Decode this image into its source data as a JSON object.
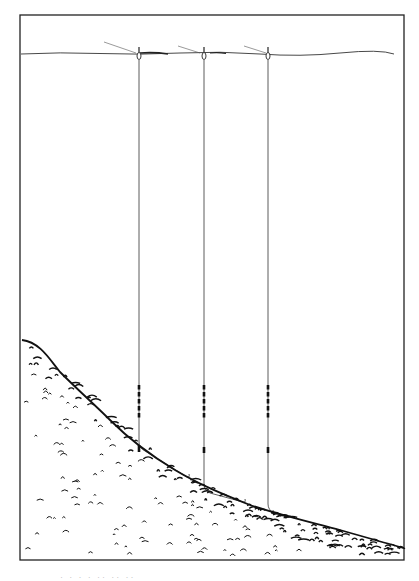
{
  "figure": {
    "frame": {
      "x": 20,
      "y": 15,
      "width": 384,
      "height": 545,
      "stroke": "#222222"
    },
    "water_surface_y": 53,
    "line_color": "#333333",
    "bed_color": "#111111",
    "rigs": [
      {
        "name": "rig-left",
        "x": 139,
        "bottom_y": 448,
        "tail_end": [
          187,
          477
        ],
        "shot_bands": [
          [
            385,
            420
          ],
          [
            445,
            452
          ]
        ],
        "has_second_shot": false,
        "rod_line": [
          [
            104,
            42
          ],
          [
            136,
            53
          ]
        ]
      },
      {
        "name": "rig-middle",
        "x": 204,
        "bottom_y": 490,
        "tail_end": [
          243,
          502
        ],
        "shot_bands": [
          [
            385,
            420
          ],
          [
            447,
            453
          ]
        ],
        "has_second_shot": true,
        "rod_line": [
          [
            178,
            46
          ],
          [
            200,
            53
          ]
        ]
      },
      {
        "name": "rig-right",
        "x": 268,
        "bottom_y": 510,
        "tail_end": [
          271,
          513
        ],
        "shot_bands": [
          [
            385,
            420
          ],
          [
            447,
            453
          ]
        ],
        "has_second_shot": true,
        "rod_line": [
          [
            244,
            46
          ],
          [
            266,
            53
          ]
        ]
      }
    ]
  },
  "caption": {
    "text": "· · ·  · ·· ·· ··"
  }
}
